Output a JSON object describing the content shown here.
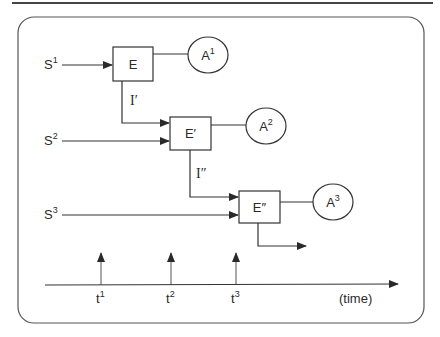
{
  "diagram": {
    "type": "process-timeline",
    "signals": [
      {
        "base": "S",
        "sup": "1"
      },
      {
        "base": "S",
        "sup": "2"
      },
      {
        "base": "S",
        "sup": "3"
      }
    ],
    "processors": [
      {
        "base": "E",
        "prime": ""
      },
      {
        "base": "E",
        "prime": "′"
      },
      {
        "base": "E",
        "prime": "″"
      }
    ],
    "outputs": [
      {
        "base": "A",
        "sup": "1"
      },
      {
        "base": "A",
        "sup": "2"
      },
      {
        "base": "A",
        "sup": "3"
      }
    ],
    "intermediates": [
      {
        "base": "I",
        "prime": "′"
      },
      {
        "base": "I",
        "prime": "″"
      }
    ],
    "time_ticks": [
      {
        "base": "t",
        "sup": "1"
      },
      {
        "base": "t",
        "sup": "2"
      },
      {
        "base": "t",
        "sup": "3"
      }
    ],
    "time_axis_label": "(time)"
  },
  "colors": {
    "stroke": "#3a3a3a",
    "text": "#2a2a2a",
    "background": "#ffffff"
  }
}
